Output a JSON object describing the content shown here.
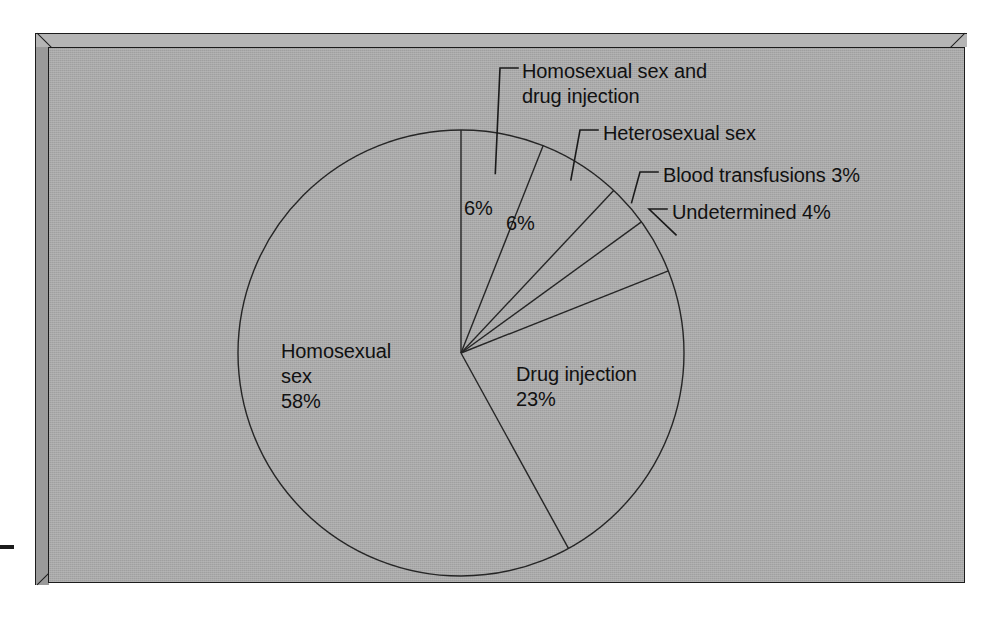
{
  "figure": {
    "background_color": "#ffffff",
    "panel_color": "#a9a9a9",
    "line_color": "#252525",
    "text_color": "#111111"
  },
  "labels": {
    "homosexual_sex_and_drug_injection": "Homosexual sex and\ndrug injection",
    "heterosexual_sex": "Heterosexual sex",
    "blood_transfusions": "Blood transfusions 3%",
    "undetermined": "Undetermined 4%",
    "drug_injection": "Drug injection\n23%",
    "homosexual_sex": "Homosexual\nsex\n58%",
    "pct_slice_1": "6%",
    "pct_slice_2": "6%"
  },
  "chart_data": {
    "type": "pie",
    "title": "",
    "xlabel": "",
    "ylabel": "",
    "legend_position": "none",
    "grid": false,
    "units": "percent",
    "start_angle_deg": 0,
    "direction": "clockwise",
    "categories": [
      "Homosexual sex and drug injection",
      "Heterosexual sex",
      "Blood transfusions",
      "Undetermined",
      "Drug injection",
      "Homosexual sex"
    ],
    "values": [
      6,
      6,
      3,
      4,
      23,
      58
    ],
    "slices": [
      {
        "name": "Homosexual sex and drug injection",
        "value": 6,
        "label": "Homosexual sex and drug injection",
        "value_label": "6%",
        "start_deg": 0,
        "end_deg": 21.6,
        "has_leader_line": true
      },
      {
        "name": "Heterosexual sex",
        "value": 6,
        "label": "Heterosexual sex",
        "value_label": "6%",
        "start_deg": 21.6,
        "end_deg": 43.2,
        "has_leader_line": true
      },
      {
        "name": "Blood transfusions",
        "value": 3,
        "label": "Blood transfusions 3%",
        "value_label": "3%",
        "start_deg": 43.2,
        "end_deg": 54.0,
        "has_leader_line": true
      },
      {
        "name": "Undetermined",
        "value": 4,
        "label": "Undetermined 4%",
        "value_label": "4%",
        "start_deg": 54.0,
        "end_deg": 68.4,
        "has_leader_line": true
      },
      {
        "name": "Drug injection",
        "value": 23,
        "label": "Drug injection",
        "value_label": "23%",
        "start_deg": 68.4,
        "end_deg": 151.2,
        "has_leader_line": false
      },
      {
        "name": "Homosexual sex",
        "value": 58,
        "label": "Homosexual sex",
        "value_label": "58%",
        "start_deg": 151.2,
        "end_deg": 360.0,
        "has_leader_line": false
      }
    ],
    "total": 100
  },
  "geometry": {
    "center_x": 461,
    "center_y": 353,
    "radius": 223
  }
}
